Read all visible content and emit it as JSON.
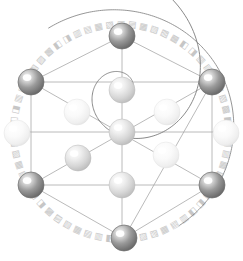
{
  "figure": {
    "title": "Sacred Geometry Sphere Lattice",
    "background_color": "#ffffff",
    "width": 243,
    "height": 261
  },
  "palette": {
    "dark_node_edge": "#6e6e6e",
    "dark_node_core": "#8e8e8e",
    "dark_node_highlight": "#f2f2f2",
    "mid_node_edge": "#b9b9b9",
    "mid_node_core": "#d8d8d8",
    "mid_node_highlight": "#ffffff",
    "light_node_edge": "#e2e2e2",
    "light_node_core": "#f3f3f3",
    "light_node_highlight": "#ffffff",
    "line_color": "#a8a8a8",
    "spiral_color": "#7c7c7c",
    "arc_color": "#8a8a8a",
    "glyph_color": "#bdbdbd"
  },
  "glyph_ring": {
    "label": "rune-ring",
    "center_x": 121,
    "center_y": 132,
    "radius": 108,
    "count": 60,
    "glyph_char": "▥",
    "glyph_size": 9,
    "note": "repeated blocky rune glyphs rotated tangentially around the circle"
  },
  "outer_arc": {
    "label": "outer-arc",
    "center_x": 112,
    "center_y": 128,
    "radius_x": 122,
    "radius_y": 118,
    "rotation_deg": -14,
    "start_deg": -108,
    "end_deg": 70
  },
  "spiral": {
    "label": "golden-spiral",
    "center_x": 122,
    "center_y": 90,
    "a": 1.6,
    "b": 0.306,
    "turns": 2.35,
    "start_angle_deg": 0
  },
  "grid_lines": [
    {
      "name": "horizontal-upper",
      "x1": 31,
      "y1": 82,
      "x2": 212,
      "y2": 82
    },
    {
      "name": "horizontal-middle",
      "x1": 28,
      "y1": 132,
      "x2": 215,
      "y2": 132
    },
    {
      "name": "horizontal-lower",
      "x1": 31,
      "y1": 185,
      "x2": 212,
      "y2": 185
    },
    {
      "name": "vertical-axis",
      "x1": 122,
      "y1": 28,
      "x2": 122,
      "y2": 238
    }
  ],
  "pentagon_edges": [
    {
      "name": "edge-top-to-topleft",
      "x1": 122,
      "y1": 36,
      "x2": 31,
      "y2": 82
    },
    {
      "name": "edge-top-to-topright",
      "x1": 122,
      "y1": 36,
      "x2": 212,
      "y2": 82
    },
    {
      "name": "edge-topleft-to-bottomleft",
      "x1": 31,
      "y1": 82,
      "x2": 31,
      "y2": 185
    },
    {
      "name": "edge-topright-to-bottomright",
      "x1": 212,
      "y1": 82,
      "x2": 212,
      "y2": 185
    },
    {
      "name": "edge-bottomleft-to-bottom",
      "x1": 31,
      "y1": 185,
      "x2": 124,
      "y2": 238
    },
    {
      "name": "edge-bottomright-to-bottom",
      "x1": 212,
      "y1": 185,
      "x2": 124,
      "y2": 238
    }
  ],
  "chord_lines": [
    {
      "name": "chord-topleft-to-bottomright",
      "x1": 31,
      "y1": 82,
      "x2": 212,
      "y2": 185
    },
    {
      "name": "chord-topright-to-bottom",
      "x1": 212,
      "y1": 82,
      "x2": 124,
      "y2": 238
    },
    {
      "name": "chord-bottomleft-to-topright",
      "x1": 31,
      "y1": 185,
      "x2": 212,
      "y2": 82
    }
  ],
  "nodes": [
    {
      "name": "node-top",
      "x": 122,
      "y": 36,
      "r": 13,
      "tone": "dark"
    },
    {
      "name": "node-top-left",
      "x": 31,
      "y": 82,
      "r": 13,
      "tone": "dark"
    },
    {
      "name": "node-top-right",
      "x": 212,
      "y": 82,
      "r": 13,
      "tone": "dark"
    },
    {
      "name": "node-bottom-left",
      "x": 31,
      "y": 185,
      "r": 13,
      "tone": "dark"
    },
    {
      "name": "node-bottom-right",
      "x": 212,
      "y": 185,
      "r": 13,
      "tone": "dark"
    },
    {
      "name": "node-bottom",
      "x": 124,
      "y": 238,
      "r": 13,
      "tone": "dark"
    },
    {
      "name": "node-ring-left",
      "x": 17,
      "y": 133,
      "r": 13,
      "tone": "light"
    },
    {
      "name": "node-ring-right",
      "x": 226,
      "y": 133,
      "r": 13,
      "tone": "light"
    },
    {
      "name": "node-center",
      "x": 122,
      "y": 132,
      "r": 13,
      "tone": "mid"
    },
    {
      "name": "node-upper-center",
      "x": 122,
      "y": 90,
      "r": 13,
      "tone": "mid"
    },
    {
      "name": "node-lower-center",
      "x": 122,
      "y": 185,
      "r": 13,
      "tone": "mid"
    },
    {
      "name": "node-inner-left",
      "x": 78,
      "y": 158,
      "r": 13,
      "tone": "mid"
    },
    {
      "name": "node-inner-upper-left",
      "x": 77,
      "y": 112,
      "r": 13,
      "tone": "light"
    },
    {
      "name": "node-inner-upper-right",
      "x": 167,
      "y": 112,
      "r": 13,
      "tone": "light"
    },
    {
      "name": "node-inner-right",
      "x": 166,
      "y": 155,
      "r": 13,
      "tone": "light"
    }
  ]
}
